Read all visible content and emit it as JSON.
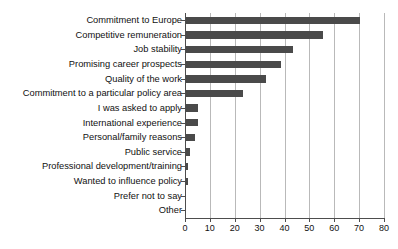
{
  "chart_data": {
    "type": "bar",
    "orientation": "horizontal",
    "title": "",
    "subtitle": "",
    "xlabel": "",
    "ylabel": "",
    "xlim": [
      0,
      80
    ],
    "xticks": [
      0,
      10,
      20,
      30,
      40,
      50,
      60,
      70,
      80
    ],
    "grid": true,
    "grid_axis": "x",
    "legend": false,
    "bar_color": "#4a4a4a",
    "axis_color": "#4d4d4d",
    "gridline_color": "#b9b9b9",
    "categories": [
      "Commitment to Europe",
      "Competitive remuneration",
      "Job stability",
      "Promising career prospects",
      "Quality of the work",
      "Commitment to a particular policy area",
      "I was asked to apply",
      "International experience",
      "Personal/family reasons",
      "Public service",
      "Professional development/training",
      "Wanted to influence policy",
      "Prefer not to say",
      "Other"
    ],
    "values": [
      70,
      55,
      43,
      38,
      32,
      23,
      5,
      5,
      3.5,
      1.5,
      0.8,
      0.8,
      0,
      0
    ]
  }
}
